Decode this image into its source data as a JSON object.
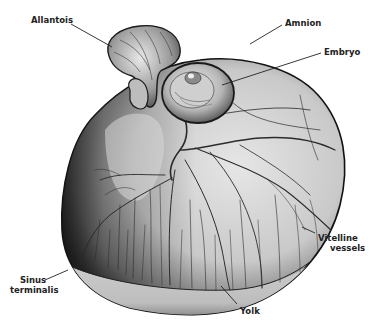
{
  "figure": {
    "colors": {
      "background": "#ffffff",
      "ink": "#1a1a1a",
      "sac_light": "#d9d9d9",
      "sac_dark": "#2a2a2a",
      "yolk_band": "#c8c8c8",
      "vessel": "#2b2b2b",
      "label_text": "#222222"
    }
  },
  "labels": {
    "allantois": "Allantois",
    "amnion": "Amnion",
    "embryo": "Embryo",
    "vitelline_line1": "Vitelline",
    "vitelline_line2": "vessels",
    "sinus_line1": "Sinus",
    "sinus_line2": "terminalis",
    "yolk": "Yolk"
  }
}
